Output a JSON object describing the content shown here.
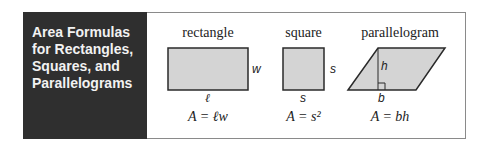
{
  "title": "Area Formulas\nfor Rectangles,\nSquares, and\nParallelograms",
  "shapes": [
    {
      "name": "rectangle",
      "labels": {
        "side": "w",
        "base": "ℓ"
      },
      "formula": "A = ℓw"
    },
    {
      "name": "square",
      "labels": {
        "side": "s",
        "base": "s"
      },
      "formula": "A = s²"
    },
    {
      "name": "parallelogram",
      "labels": {
        "height": "h",
        "base": "b"
      },
      "formula": "A = bh"
    }
  ],
  "colors": {
    "panel": "#2f2f2f",
    "fill": "#d4d4d4",
    "stroke": "#2a2a2a"
  }
}
